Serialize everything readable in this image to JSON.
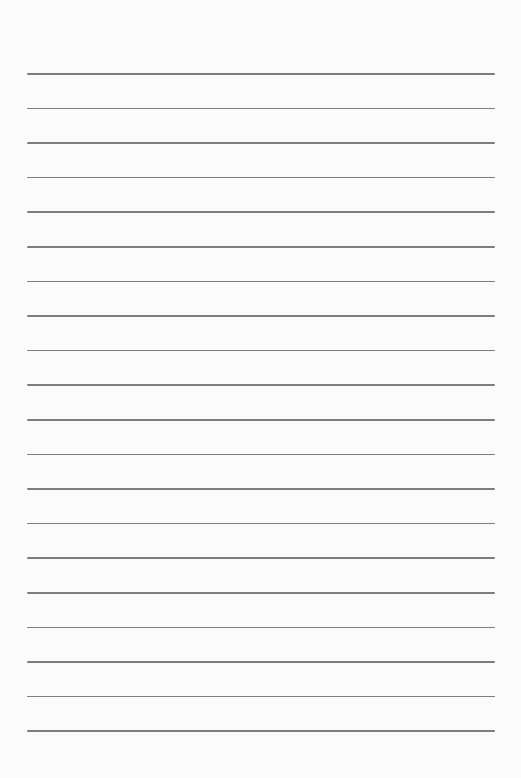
{
  "page": {
    "type": "lined-paper",
    "background_color": "#fbfbfb",
    "rule_color": "#7d7d7d",
    "rule_count": 20,
    "first_rule_y": 73,
    "rule_spacing": 34.6,
    "rule_left": 27,
    "rule_width": 468,
    "text_lines": []
  }
}
